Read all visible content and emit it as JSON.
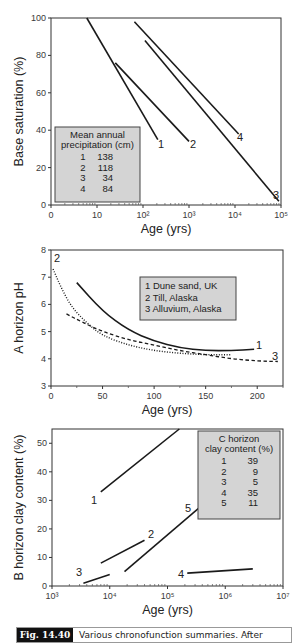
{
  "chart_data": [
    {
      "type": "line",
      "xscale": "log",
      "xlabel": "Age (yrs)",
      "ylabel": "Base saturation (%)",
      "xlim": [
        1,
        100000
      ],
      "ylim": [
        0,
        100
      ],
      "x_tick_labels": [
        "0",
        "10",
        "10²",
        "10³",
        "10⁴",
        "10⁵"
      ],
      "y_ticks": [
        0,
        20,
        40,
        60,
        80,
        100
      ],
      "legend": {
        "position": "bottom-left",
        "title_lines": [
          "Mean annual",
          "precipitation (cm)"
        ],
        "rows": [
          [
            "1",
            "138"
          ],
          [
            "2",
            "118"
          ],
          [
            "3",
            "34"
          ],
          [
            "4",
            "84"
          ]
        ]
      },
      "series": [
        {
          "name": "1",
          "style": "solid",
          "points": [
            [
              6,
              100
            ],
            [
              210,
              35
            ]
          ]
        },
        {
          "name": "2",
          "style": "solid",
          "points": [
            [
              25,
              76
            ],
            [
              1000,
              34
            ]
          ]
        },
        {
          "name": "3",
          "style": "solid",
          "points": [
            [
              110,
              88
            ],
            [
              90000,
              2
            ]
          ]
        },
        {
          "name": "4",
          "style": "solid",
          "points": [
            [
              65,
              98
            ],
            [
              12000,
              38
            ]
          ]
        }
      ]
    },
    {
      "type": "line",
      "xscale": "linear",
      "xlabel": "Age (yrs)",
      "ylabel": "A horizon pH",
      "xlim": [
        0,
        225
      ],
      "ylim": [
        3,
        8
      ],
      "x_ticks": [
        0,
        50,
        100,
        150,
        200
      ],
      "y_ticks": [
        3,
        4,
        5,
        6,
        7,
        8
      ],
      "legend": {
        "position": "top-right",
        "rows": [
          "1  Dune sand, UK",
          "2  Till, Alaska",
          "3  Alluvium, Alaska"
        ]
      },
      "series": [
        {
          "name": "1",
          "label": "Dune sand, UK",
          "style": "solid",
          "points": [
            [
              25,
              6.8
            ],
            [
              50,
              5.75
            ],
            [
              75,
              5.05
            ],
            [
              100,
              4.65
            ],
            [
              125,
              4.4
            ],
            [
              150,
              4.3
            ],
            [
              175,
              4.3
            ],
            [
              197,
              4.35
            ]
          ]
        },
        {
          "name": "2",
          "label": "Till, Alaska",
          "style": "dotted",
          "points": [
            [
              2,
              7.3
            ],
            [
              10,
              6.6
            ],
            [
              20,
              5.9
            ],
            [
              35,
              5.3
            ],
            [
              50,
              4.85
            ],
            [
              75,
              4.5
            ],
            [
              100,
              4.3
            ],
            [
              125,
              4.2
            ],
            [
              150,
              4.15
            ],
            [
              175,
              4.15
            ]
          ]
        },
        {
          "name": "3",
          "label": "Alluvium, Alaska",
          "style": "dashed",
          "points": [
            [
              15,
              5.65
            ],
            [
              30,
              5.35
            ],
            [
              50,
              5.0
            ],
            [
              75,
              4.7
            ],
            [
              100,
              4.5
            ],
            [
              125,
              4.3
            ],
            [
              150,
              4.15
            ],
            [
              175,
              4.0
            ],
            [
              200,
              3.92
            ],
            [
              220,
              3.9
            ]
          ]
        }
      ]
    },
    {
      "type": "line",
      "xscale": "log",
      "xlabel": "Age (yrs)",
      "ylabel": "B horizon clay content (%)",
      "xlim": [
        1000,
        10000000
      ],
      "ylim": [
        0,
        55
      ],
      "x_tick_labels": [
        "10³",
        "10⁴",
        "10⁵",
        "10⁶",
        "10⁷"
      ],
      "y_ticks": [
        0,
        10,
        20,
        30,
        40,
        50
      ],
      "legend": {
        "position": "top-right",
        "title_lines": [
          "C horizon",
          "clay content (%)"
        ],
        "rows": [
          [
            "1",
            "39"
          ],
          [
            "2",
            "9"
          ],
          [
            "3",
            "5"
          ],
          [
            "4",
            "35"
          ],
          [
            "5",
            "11"
          ]
        ]
      },
      "series": [
        {
          "name": "1",
          "style": "solid",
          "points": [
            [
              7000,
              33
            ],
            [
              160000,
              55
            ]
          ]
        },
        {
          "name": "2",
          "style": "solid",
          "points": [
            [
              7000,
              8
            ],
            [
              40000,
              16
            ]
          ]
        },
        {
          "name": "3",
          "style": "solid",
          "points": [
            [
              3500,
              1
            ],
            [
              10000,
              4
            ]
          ]
        },
        {
          "name": "4",
          "style": "solid",
          "points": [
            [
              220000,
              4.5
            ],
            [
              3000000,
              6
            ]
          ]
        },
        {
          "name": "5",
          "style": "solid",
          "points": [
            [
              18000,
              5
            ],
            [
              500000,
              30
            ]
          ]
        }
      ]
    }
  ],
  "caption": {
    "tag": "Fig. 14.40",
    "text": "Various chronofunction summaries. After"
  }
}
